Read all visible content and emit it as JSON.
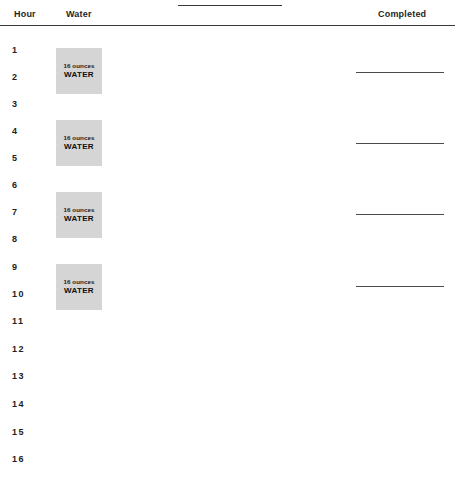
{
  "document": {
    "title": "Water Intake Tracker",
    "top_rule": {
      "left": 178,
      "top": 5,
      "width": 104
    }
  },
  "header": {
    "hour_label": "Hour",
    "water_label": "Water",
    "completed_label": "Completed"
  },
  "hours": [
    {
      "label": "1",
      "top": 44
    },
    {
      "label": "2",
      "top": 71
    },
    {
      "label": "3",
      "top": 98
    },
    {
      "label": "4",
      "top": 125
    },
    {
      "label": "5",
      "top": 152
    },
    {
      "label": "6",
      "top": 179
    },
    {
      "label": "7",
      "top": 206
    },
    {
      "label": "8",
      "top": 233
    },
    {
      "label": "9",
      "top": 261
    },
    {
      "label": "10",
      "top": 288
    },
    {
      "label": "11",
      "top": 315
    },
    {
      "label": "12",
      "top": 343
    },
    {
      "label": "13",
      "top": 370
    },
    {
      "label": "14",
      "top": 398
    },
    {
      "label": "15",
      "top": 426
    },
    {
      "label": "16",
      "top": 453
    }
  ],
  "water_boxes": [
    {
      "ounces": "16 ounces",
      "label": "WATER",
      "top": 48,
      "hour_span": "1-2"
    },
    {
      "ounces": "16 ounces",
      "label": "WATER",
      "top": 120,
      "hour_span": "4-5"
    },
    {
      "ounces": "16 ounces",
      "label": "WATER",
      "top": 192,
      "hour_span": "7-8"
    },
    {
      "ounces": "16 ounces",
      "label": "WATER",
      "top": 264,
      "hour_span": "9-10"
    }
  ],
  "completed_lines": [
    {
      "top": 72,
      "hour": "2"
    },
    {
      "top": 143,
      "hour": "5"
    },
    {
      "top": 214,
      "hour": "7"
    },
    {
      "top": 286,
      "hour": "10"
    }
  ],
  "colors": {
    "page_background": "#ffffff",
    "text": "#1a1a1a",
    "rule": "#3a3a3a",
    "water_box_fill": "#d5d5d5",
    "completed_line": "#4a4a4a"
  }
}
